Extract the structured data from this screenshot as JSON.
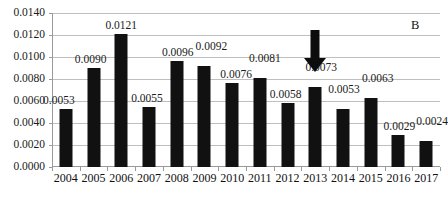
{
  "chart_data": {
    "type": "bar",
    "title": "",
    "subtitle": "",
    "panel_label": "B",
    "xlabel": "",
    "ylabel": "",
    "ylim": [
      0.0,
      0.014
    ],
    "ytick_step": 0.002,
    "grid": true,
    "legend": "none",
    "bar_color": "#111111",
    "gridline_color": "#bfbfbf",
    "axis_color": "#9a9a9a",
    "categories": [
      "2004",
      "2005",
      "2006",
      "2007",
      "2008",
      "2009",
      "2010",
      "2011",
      "2012",
      "2013",
      "2014",
      "2015",
      "2016",
      "2017"
    ],
    "values": [
      0.0053,
      0.009,
      0.0121,
      0.0055,
      0.0096,
      0.0092,
      0.0076,
      0.0081,
      0.0058,
      0.0073,
      0.0053,
      0.0063,
      0.0029,
      0.0024
    ],
    "data_labels": [
      "0.0053",
      "0.0090",
      "0.0121",
      "0.0055",
      "0.0096",
      "0.0092",
      "0.0076",
      "0.0081",
      "0.0058",
      "0.0073",
      "0.0053",
      "0.0063",
      "0.0029",
      "0.0024"
    ],
    "ytick_labels": [
      "0.0000",
      "0.0020",
      "0.0040",
      "0.0060",
      "0.0080",
      "0.0100",
      "0.0120",
      "0.0140"
    ],
    "ytick_values": [
      0.0,
      0.002,
      0.004,
      0.006,
      0.008,
      0.01,
      0.012,
      0.014
    ],
    "annotations": [
      {
        "name": "down-arrow",
        "type": "arrow",
        "direction": "down",
        "points_to_category": "2013",
        "color": "#0c0c0c"
      }
    ]
  }
}
